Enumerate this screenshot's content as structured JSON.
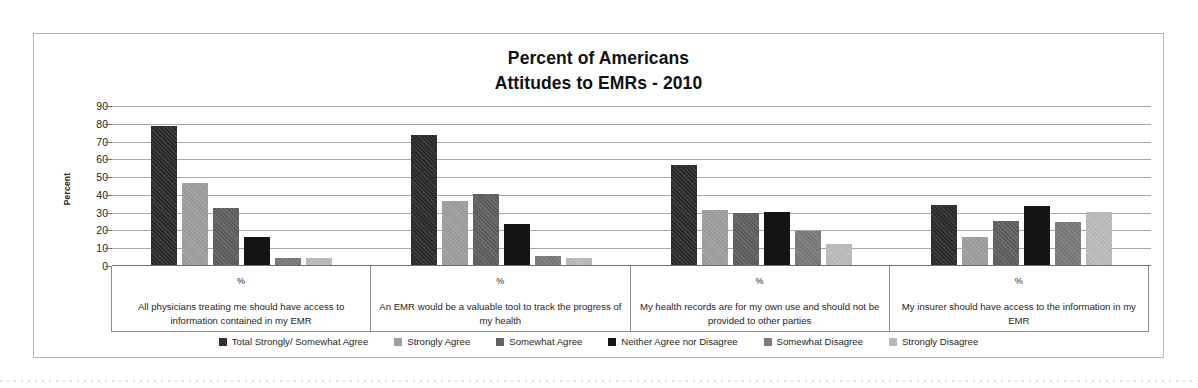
{
  "chart_data": {
    "type": "bar",
    "title": "Percent of Americans Attitudes to EMRs - 2010",
    "title_lines": [
      "Percent of Americans",
      "Attitudes to EMRs - 2010"
    ],
    "xlabel": "",
    "ylabel": "Percent",
    "ylim": [
      0,
      90
    ],
    "ytick_step": 10,
    "yticks": [
      90,
      80,
      70,
      60,
      50,
      40,
      30,
      20,
      10,
      0
    ],
    "grid": true,
    "legend_position": "bottom",
    "unit_label": "%",
    "categories": [
      "All physicians treating me should have access to information contained in my EMR",
      "An EMR would be a valuable tool to track the progress of my health",
      "My health records are for my own use and should not be provided to other parties",
      "My insurer should have access to the information in my EMR"
    ],
    "series": [
      {
        "name": "Total Strongly/ Somewhat Agree",
        "color": "#2b2b2b",
        "values": [
          78,
          73,
          56,
          34
        ]
      },
      {
        "name": "Strongly Agree",
        "color": "#9a9a9a",
        "values": [
          46,
          36,
          31,
          16
        ]
      },
      {
        "name": "Somewhat Agree",
        "color": "#5c5c5c",
        "values": [
          32,
          40,
          29,
          25
        ]
      },
      {
        "name": "Neither Agree nor Disagree",
        "color": "#141414",
        "values": [
          16,
          23,
          30,
          33
        ]
      },
      {
        "name": "Somewhat Disagree",
        "color": "#767676",
        "values": [
          4,
          5,
          19,
          24
        ]
      },
      {
        "name": "Strongly Disagree",
        "color": "#b6b6b6",
        "values": [
          4,
          4,
          12,
          30
        ]
      }
    ]
  }
}
